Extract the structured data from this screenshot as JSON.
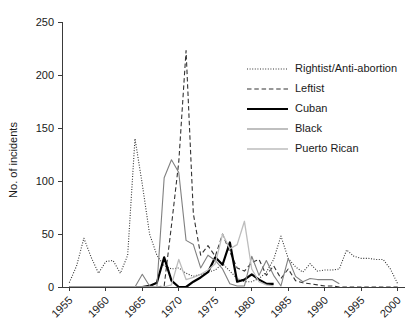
{
  "chart_data": {
    "type": "line",
    "title": "",
    "xlabel": "",
    "ylabel": "No. of incidents",
    "xlim": [
      1954,
      2001
    ],
    "ylim": [
      0,
      250
    ],
    "xticks": [
      1955,
      1960,
      1965,
      1970,
      1975,
      1980,
      1985,
      1990,
      1995,
      2000
    ],
    "xticklabels": [
      "1955",
      "1960",
      "1965",
      "1970",
      "1975",
      "1980",
      "1985",
      "1990",
      "1995",
      "2000"
    ],
    "yticks": [
      0,
      50,
      100,
      150,
      200,
      250
    ],
    "yticklabels": [
      "0",
      "50",
      "100",
      "150",
      "200",
      "250"
    ],
    "grid": false,
    "legend_position": "upper right",
    "xtick_rotation": 45,
    "series": [
      {
        "name": "Rightist/Anti-abortion",
        "style": "dotted",
        "color": "#333333",
        "width": 1.1,
        "x": [
          1955,
          1956,
          1957,
          1958,
          1959,
          1960,
          1961,
          1962,
          1963,
          1964,
          1965,
          1966,
          1967,
          1968,
          1969,
          1970,
          1971,
          1972,
          1973,
          1974,
          1975,
          1976,
          1977,
          1978,
          1979,
          1980,
          1981,
          1982,
          1983,
          1984,
          1985,
          1986,
          1987,
          1988,
          1989,
          1990,
          1991,
          1992,
          1993,
          1994,
          1995,
          1996,
          1997,
          1998,
          1999,
          2000
        ],
        "values": [
          4,
          20,
          46,
          28,
          13,
          24,
          25,
          13,
          30,
          140,
          97,
          50,
          30,
          20,
          17,
          18,
          13,
          10,
          12,
          14,
          16,
          22,
          15,
          8,
          5,
          5,
          8,
          14,
          26,
          48,
          27,
          19,
          14,
          22,
          15,
          16,
          16,
          17,
          35,
          29,
          27,
          27,
          26,
          26,
          17,
          3
        ]
      },
      {
        "name": "Leftist",
        "style": "dashed",
        "color": "#333333",
        "width": 1.1,
        "x": [
          1955,
          1956,
          1957,
          1958,
          1959,
          1960,
          1961,
          1962,
          1963,
          1964,
          1965,
          1966,
          1967,
          1968,
          1969,
          1970,
          1971,
          1972,
          1973,
          1974,
          1975,
          1976,
          1977,
          1978,
          1979,
          1980,
          1981,
          1982,
          1983,
          1984,
          1985,
          1986,
          1987,
          1988,
          1989,
          1990,
          1991,
          1992,
          1993,
          1994,
          1995,
          1996,
          1997,
          1998,
          1999,
          2000
        ],
        "values": [
          0,
          0,
          0,
          0,
          0,
          0,
          0,
          0,
          0,
          0,
          0,
          0,
          0,
          1,
          58,
          118,
          223,
          69,
          30,
          39,
          29,
          50,
          33,
          18,
          15,
          23,
          26,
          11,
          20,
          8,
          17,
          6,
          4,
          3,
          2,
          1,
          1,
          0,
          0,
          0,
          0,
          0,
          0,
          0,
          0,
          0
        ]
      },
      {
        "name": "Cuban",
        "style": "solid",
        "color": "#000000",
        "width": 2.2,
        "x": [
          1955,
          1960,
          1965,
          1966,
          1967,
          1968,
          1969,
          1970,
          1971,
          1972,
          1973,
          1974,
          1975,
          1976,
          1977,
          1978,
          1979,
          1980,
          1981,
          1982,
          1983
        ],
        "values": [
          0,
          0,
          0,
          1,
          4,
          28,
          6,
          0,
          0,
          5,
          9,
          14,
          28,
          21,
          42,
          5,
          7,
          12,
          7,
          3,
          3
        ]
      },
      {
        "name": "Black",
        "style": "solid",
        "color": "#808080",
        "width": 1.1,
        "x": [
          1955,
          1960,
          1964,
          1965,
          1966,
          1967,
          1968,
          1969,
          1970,
          1971,
          1972,
          1973,
          1974,
          1975,
          1976,
          1977,
          1978,
          1979,
          1980,
          1981,
          1982,
          1983,
          1984,
          1985,
          1986,
          1987,
          1988,
          1989,
          1990,
          1991,
          1992
        ],
        "values": [
          0,
          0,
          0,
          12,
          1,
          0,
          103,
          120,
          108,
          44,
          40,
          18,
          30,
          25,
          17,
          3,
          1,
          1,
          29,
          11,
          25,
          11,
          1,
          27,
          10,
          5,
          8,
          7,
          7,
          7,
          3
        ]
      },
      {
        "name": "Puerto Rican",
        "style": "solid",
        "color": "#bdbdbd",
        "width": 1.3,
        "x": [
          1955,
          1960,
          1965,
          1968,
          1969,
          1970,
          1971,
          1972,
          1973,
          1974,
          1975,
          1976,
          1977,
          1978,
          1979,
          1980,
          1981,
          1982,
          1983
        ],
        "values": [
          0,
          0,
          0,
          0,
          2,
          26,
          7,
          9,
          12,
          16,
          22,
          50,
          36,
          40,
          62,
          17,
          5,
          2,
          1
        ]
      }
    ]
  },
  "legend": {
    "entries": [
      {
        "label": "Rightist/Anti-abortion"
      },
      {
        "label": "Leftist"
      },
      {
        "label": "Cuban"
      },
      {
        "label": "Black"
      },
      {
        "label": "Puerto Rican"
      }
    ]
  }
}
